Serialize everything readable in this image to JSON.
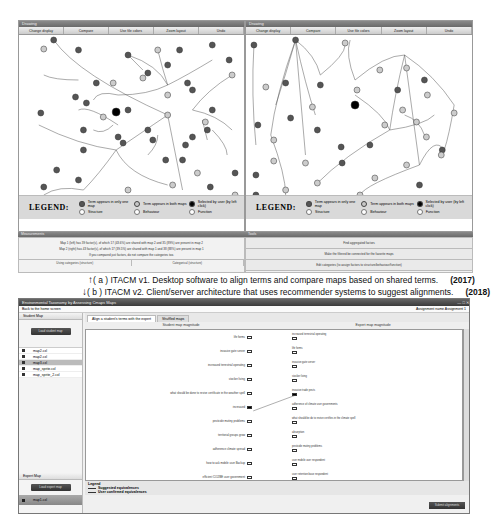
{
  "v1": {
    "left_panel": {
      "title": "Drawing",
      "toolbar": [
        "Change display",
        "Compare",
        "Use file colors",
        "Zoom layout",
        "Undo"
      ],
      "legend": {
        "title": "LEGEND:",
        "items": [
          {
            "label": "Term appears in only one map",
            "style": "dark"
          },
          {
            "label": "Term appears in both maps",
            "style": "light"
          },
          {
            "label": "Selected by user (by left click)",
            "style": "black"
          },
          {
            "label": "Structure",
            "style": "ring"
          },
          {
            "label": "Behaviour",
            "style": "ring"
          },
          {
            "label": "Function",
            "style": "ring"
          }
        ]
      },
      "footer": {
        "title": "Measurements",
        "lines": [
          "Map 1 (left) has 39 factor(s), of which 17 (43.6%) are shared with map 2 and 35 (89%) are present in map 2",
          "Map 2 (right) has 43 factor(s), of which 17 (39.5%) are shared with map 1 and 38 (88%) are present in map 1",
          "If you compared just factors, do not compare the categories too."
        ],
        "tabs": [
          "Using categories (structure)",
          "Categorical (structure)"
        ]
      }
    },
    "right_panel": {
      "title": "Drawing",
      "toolbar": [
        "Change display",
        "Compare",
        "Use file colors",
        "Zoom layout",
        "Undo"
      ],
      "legend": {
        "title": "LEGEND:",
        "items": [
          {
            "label": "Term appears in only one map",
            "style": "dark"
          },
          {
            "label": "Term appears in both maps",
            "style": "light"
          },
          {
            "label": "Selected by user (by left click)",
            "style": "black"
          },
          {
            "label": "Structure",
            "style": "ring"
          },
          {
            "label": "Behaviour",
            "style": "ring"
          },
          {
            "label": "Function",
            "style": "ring"
          }
        ]
      },
      "footer": {
        "title": "Tools",
        "buttons": [
          "Find aggregated factors",
          "Make the filtered be connected for the favorite maps",
          "Edit categories (to assign factors to structure/behaviour/function)"
        ]
      }
    }
  },
  "captions": {
    "a": {
      "arrow": "↑",
      "text": "( a ) ITACM v1. Desktop software to align terms and compare maps based on shared terms.",
      "year": "(2017)"
    },
    "b": {
      "arrow": "↓",
      "text": "( b ) ITACM v2. Client/server architecture that uses recommender systems to suggest alignments.",
      "year": "(2018)"
    }
  },
  "v2": {
    "window_title": "Environmental Taxonomy by Assessing Cmaps Maps",
    "window_controls": "— □ ✕",
    "back_link": "Back to the home screen",
    "assignment": "Assignment name Assignment 1",
    "sidebar": {
      "student_section": "Student Map",
      "load_button": "Load student map",
      "files": [
        {
          "name": "map2.cxl",
          "selected": false
        },
        {
          "name": "map2.cxl",
          "selected": false
        },
        {
          "name": "map3.cxl",
          "selected": true
        },
        {
          "name": "map_sprite.cxl",
          "selected": false
        },
        {
          "name": "map_sprite_2.cxl",
          "selected": false
        }
      ],
      "expert_section": "Expert Map",
      "expert_button": "Load expert map",
      "expert_file": "map1.cxl"
    },
    "tabs": [
      {
        "label": "Align a student's terms with the expert",
        "active": true
      },
      {
        "label": "Shuffled maps",
        "active": false
      }
    ],
    "columns": {
      "student": "Student map magnitude",
      "expert": "Expert map magnitude"
    },
    "student_terms": [
      {
        "label": "life forms",
        "selected": false
      },
      {
        "label": "invasive gate server",
        "selected": false
      },
      {
        "label": "increased terrestrial operating",
        "selected": false
      },
      {
        "label": "stocker living",
        "selected": false
      },
      {
        "label": "what should be done to revive certificate in the weather spell",
        "selected": false
      },
      {
        "label": "increased",
        "selected": true
      },
      {
        "label": "pesticide mutiny problems",
        "selected": false
      },
      {
        "label": "territorial groups grow",
        "selected": false
      },
      {
        "label": "adherence climate spread",
        "selected": false
      },
      {
        "label": "how to ask mobile user Backup",
        "selected": false
      },
      {
        "label": "efficient CO2/BE user government",
        "selected": false
      }
    ],
    "expert_terms": [
      {
        "label": "increased terrestrial operating",
        "selected": false
      },
      {
        "label": "life forms",
        "selected": false
      },
      {
        "label": "invasive gate server",
        "selected": false
      },
      {
        "label": "stocker living",
        "selected": false
      },
      {
        "label": "invasive trade pests",
        "selected": true
      },
      {
        "label": "adherence of climate user governments",
        "selected": false
      },
      {
        "label": "what should be do to revive certifies in the climate spell",
        "selected": false
      },
      {
        "label": "absorption",
        "selected": false
      },
      {
        "label": "pesticide mutiny problems",
        "selected": false
      },
      {
        "label": "user mobile user respondent",
        "selected": false
      },
      {
        "label": "user retention base respondent",
        "selected": false
      }
    ],
    "legend": {
      "title": "Legend",
      "items": [
        "Suggested equivalences",
        "User confirmed equivalences"
      ]
    },
    "submit_button": "Submit alignments"
  }
}
